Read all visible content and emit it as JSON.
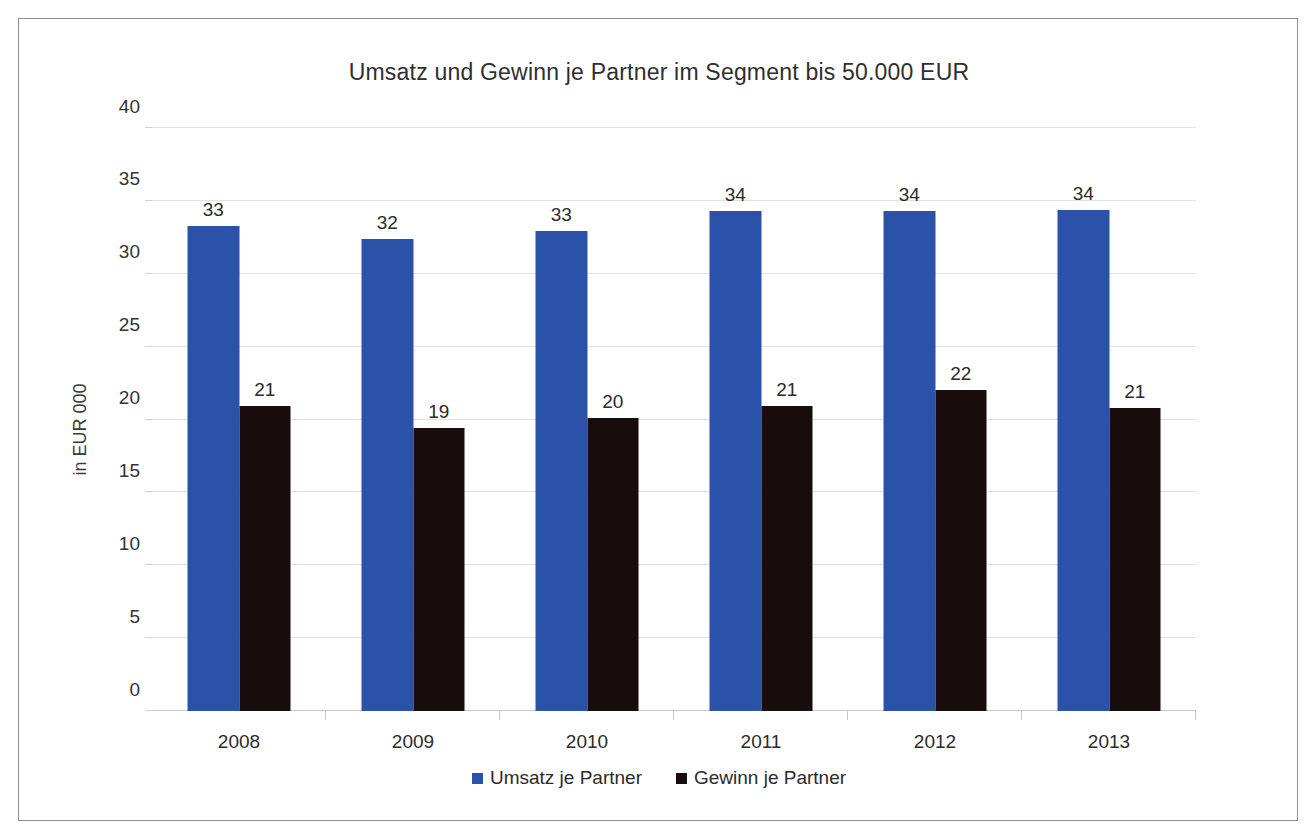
{
  "chart_data": {
    "type": "bar",
    "title": "Umsatz und Gewinn je Partner im Segment bis 50.000 EUR",
    "xlabel": "",
    "ylabel": "in EUR 000",
    "categories": [
      "2008",
      "2009",
      "2010",
      "2011",
      "2012",
      "2013"
    ],
    "series": [
      {
        "name": "Umsatz je Partner",
        "color": "#2a52a8",
        "values": [
          33,
          32,
          33,
          34,
          34,
          34
        ],
        "labels": [
          "33",
          "32",
          "33",
          "34",
          "34",
          "34"
        ],
        "exact_values": [
          33.3,
          32.4,
          32.9,
          34.3,
          34.3,
          34.4
        ]
      },
      {
        "name": "Gewinn je Partner",
        "color": "#190c0c",
        "values": [
          21,
          19,
          20,
          21,
          22,
          21
        ],
        "labels": [
          "21",
          "19",
          "20",
          "21",
          "22",
          "21"
        ],
        "exact_values": [
          20.9,
          19.4,
          20.1,
          20.9,
          22.0,
          20.8
        ]
      }
    ],
    "ylim": [
      0,
      40
    ],
    "yticks": [
      0,
      5,
      10,
      15,
      20,
      25,
      30,
      35,
      40
    ],
    "ytick_labels": [
      "0",
      "5",
      "10",
      "15",
      "20",
      "25",
      "30",
      "35",
      "40"
    ],
    "grid": true,
    "legend_position": "bottom",
    "data_labels": true
  },
  "frame": {
    "border_color": "#8e8e8e",
    "background": "#ffffff"
  }
}
